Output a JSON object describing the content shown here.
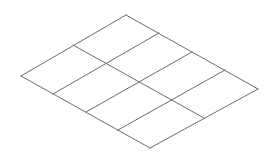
{
  "diagram": {
    "type": "isometric-grid",
    "rows": 2,
    "cols": 4,
    "stroke_color": "#6b6b6b",
    "vertices": {
      "top": [
        126,
        15
      ],
      "right": [
        258,
        89
      ],
      "bottom": [
        150,
        148
      ],
      "left": [
        21,
        76
      ]
    },
    "lines": [
      {
        "id": "outline-top-right",
        "x1": 126,
        "y1": 15,
        "x2": 258,
        "y2": 89
      },
      {
        "id": "outline-right-bottom",
        "x1": 258,
        "y1": 89,
        "x2": 150,
        "y2": 148
      },
      {
        "id": "outline-bottom-left",
        "x1": 150,
        "y1": 148,
        "x2": 21,
        "y2": 76
      },
      {
        "id": "outline-left-top",
        "x1": 21,
        "y1": 76,
        "x2": 126,
        "y2": 15
      },
      {
        "id": "row-divider",
        "x1": 73,
        "y1": 45,
        "x2": 204,
        "y2": 118
      },
      {
        "id": "col-divider-1",
        "x1": 159,
        "y1": 33,
        "x2": 53,
        "y2": 94
      },
      {
        "id": "col-divider-2",
        "x1": 192,
        "y1": 52,
        "x2": 86,
        "y2": 112
      },
      {
        "id": "col-divider-3",
        "x1": 225,
        "y1": 70,
        "x2": 118,
        "y2": 130
      }
    ]
  }
}
